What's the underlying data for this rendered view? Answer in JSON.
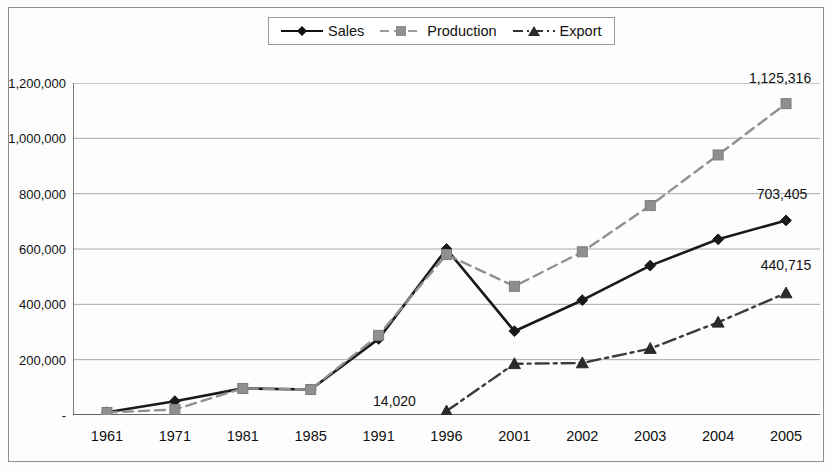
{
  "chart_data": {
    "type": "line",
    "title": "",
    "subtitle": "",
    "xlabel": "",
    "ylabel": "",
    "categories": [
      "1961",
      "1971",
      "1981",
      "1985",
      "1991",
      "1996",
      "2001",
      "2002",
      "2003",
      "2004",
      "2005"
    ],
    "ylim": [
      0,
      1200000
    ],
    "ytick_labels": [
      "1,200,000",
      "1,000,000",
      "800,000",
      "600,000",
      "400,000",
      "200,000",
      "-"
    ],
    "ytick_values": [
      1200000,
      1000000,
      800000,
      600000,
      400000,
      200000,
      0
    ],
    "grid": "horizontal",
    "legend_position": "top-center",
    "series": [
      {
        "name": "Sales",
        "color": "#1a1a1a",
        "marker": "diamond",
        "line_style": "solid",
        "values": [
          10000,
          50000,
          96000,
          92000,
          275000,
          600000,
          303000,
          415000,
          540000,
          635000,
          703405
        ]
      },
      {
        "name": "Production",
        "color": "#909090",
        "marker": "square",
        "line_style": "dashed",
        "values": [
          9000,
          20000,
          96000,
          92000,
          288000,
          580000,
          465000,
          590000,
          757000,
          940000,
          1125316
        ]
      },
      {
        "name": "Export",
        "color": "#3a3a3a",
        "marker": "triangle",
        "line_style": "dash-dot",
        "values": [
          null,
          null,
          null,
          null,
          null,
          14020,
          185000,
          188000,
          240000,
          335000,
          440715
        ]
      }
    ],
    "annotations": [
      {
        "text": "1,125,316",
        "series": "Production",
        "category": "2005",
        "value": 1125316
      },
      {
        "text": "703,405",
        "series": "Sales",
        "category": "2005",
        "value": 703405
      },
      {
        "text": "440,715",
        "series": "Export",
        "category": "2005",
        "value": 440715
      },
      {
        "text": "14,020",
        "series": "Export",
        "category": "1996",
        "value": 14020
      }
    ]
  },
  "legend": {
    "items": [
      {
        "label": "Sales",
        "key": "line-diamond-solid-black"
      },
      {
        "label": "Production",
        "key": "line-square-dashed-gray"
      },
      {
        "label": "Export",
        "key": "line-triangle-dashdot-dark"
      }
    ]
  }
}
